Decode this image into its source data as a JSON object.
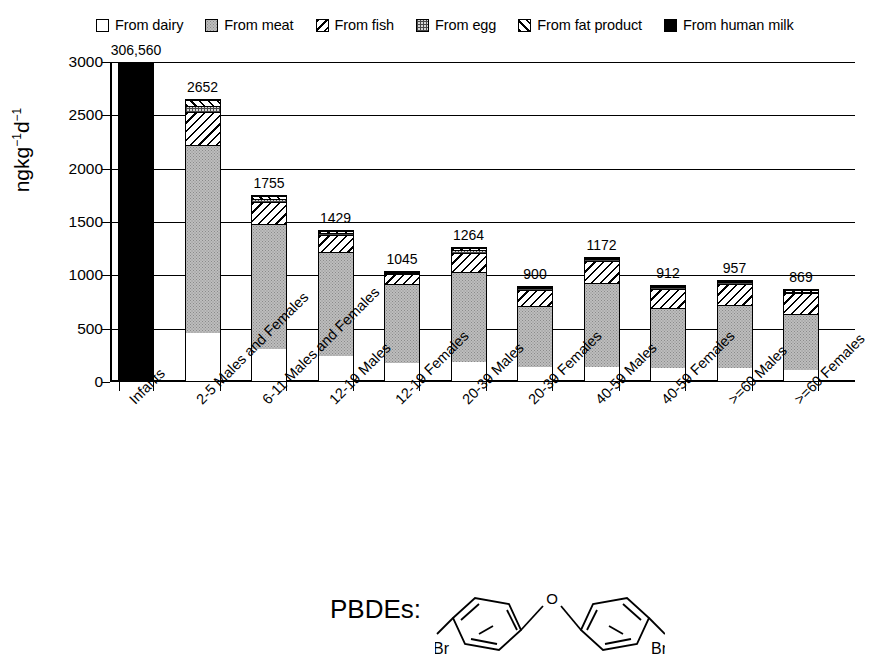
{
  "legend": {
    "items": [
      {
        "label": "From dairy",
        "pattern": "dairy",
        "icon": "white-square-icon"
      },
      {
        "label": "From meat",
        "pattern": "meat",
        "icon": "gray-dotted-square-icon"
      },
      {
        "label": "From fish",
        "pattern": "fish",
        "icon": "backslash-hatch-square-icon"
      },
      {
        "label": "From egg",
        "pattern": "egg",
        "icon": "crosshatch-square-icon"
      },
      {
        "label": "From fat product",
        "pattern": "fat",
        "icon": "forwardslash-hatch-square-icon"
      },
      {
        "label": "From human milk",
        "pattern": "milk",
        "icon": "black-square-icon"
      }
    ]
  },
  "molecule": {
    "caption": "PBDEs:",
    "atom_o": "O",
    "atom_br_left": "Br",
    "atom_br_right": "Br"
  },
  "chart_data": {
    "type": "bar",
    "stacked": true,
    "title": "",
    "xlabel": "",
    "ylabel": "ngkg⁻¹d⁻¹",
    "ylim": [
      0,
      3000
    ],
    "yticks": [
      0,
      500,
      1000,
      1500,
      2000,
      2500,
      3000
    ],
    "ytick_labels": [
      "0",
      "500",
      "1000",
      "1500",
      "2000",
      "2500",
      "3000"
    ],
    "grid": true,
    "legend_position": "top",
    "series_names": [
      "From dairy",
      "From meat",
      "From fish",
      "From egg",
      "From fat product",
      "From human milk"
    ],
    "categories": [
      "Infants",
      "2-5 Males and Females",
      "6-11 Males and Females",
      "12-19 Males",
      "12-19 Females",
      "20-39 Males",
      "20-39 Females",
      "40-59 Males",
      "40-59 Females",
      ">=60 Males",
      ">=60 Females"
    ],
    "totals": [
      306560,
      2652,
      1755,
      1429,
      1045,
      1264,
      900,
      1172,
      912,
      957,
      869
    ],
    "total_labels": [
      "306,560",
      "2652",
      "1755",
      "1429",
      "1045",
      "1264",
      "900",
      "1172",
      "912",
      "957",
      "869"
    ],
    "series": [
      {
        "name": "From dairy",
        "values": [
          0,
          450,
          300,
          240,
          175,
          180,
          130,
          130,
          120,
          120,
          110
        ]
      },
      {
        "name": "From meat",
        "values": [
          0,
          1780,
          1190,
          990,
          750,
          855,
          590,
          800,
          580,
          610,
          530
        ]
      },
      {
        "name": "From fish",
        "values": [
          0,
          310,
          205,
          160,
          95,
          185,
          155,
          215,
          185,
          195,
          200
        ]
      },
      {
        "name": "From egg",
        "values": [
          0,
          60,
          30,
          20,
          15,
          25,
          15,
          15,
          15,
          20,
          15
        ]
      },
      {
        "name": "From fat product",
        "values": [
          0,
          52,
          30,
          19,
          10,
          19,
          10,
          12,
          12,
          12,
          14
        ]
      },
      {
        "name": "From human milk",
        "values": [
          306560,
          0,
          0,
          0,
          0,
          0,
          0,
          0,
          0,
          0,
          0
        ]
      }
    ]
  }
}
